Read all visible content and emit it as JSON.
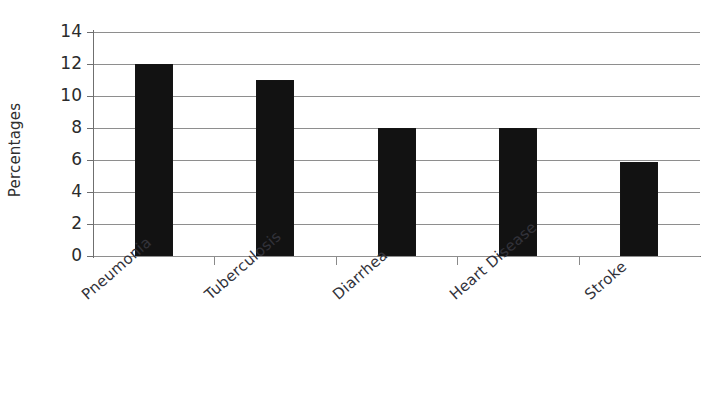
{
  "chart_data": {
    "type": "bar",
    "title": "",
    "xlabel": "",
    "ylabel": "Percentages",
    "categories": [
      "Pneumonia",
      "Tuberculosis",
      "Diarrhea",
      "Heart Disease",
      "Stroke"
    ],
    "values": [
      12,
      11,
      8,
      8,
      5.9
    ],
    "ylim": [
      0,
      14
    ],
    "ytick_labels": [
      "14",
      "12",
      "10",
      "8",
      "6",
      "4",
      "2",
      "0"
    ],
    "ytick_values": [
      14,
      12,
      10,
      8,
      6,
      4,
      2,
      0
    ],
    "grid": true,
    "legend": false,
    "bar_color": "#121212",
    "gridline_color": "#8e8e8e",
    "axis_color": "#6f6f6f",
    "background": "#ffffff",
    "category_label_rotation": -41
  }
}
